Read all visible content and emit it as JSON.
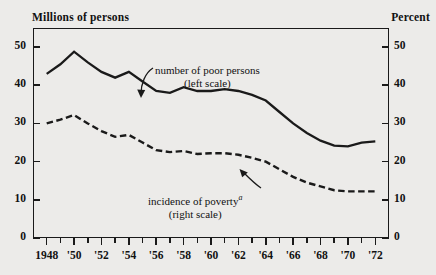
{
  "axis_titles": {
    "left": "Millions of persons",
    "right": "Percent"
  },
  "annotations": {
    "series_a_line1": "number of poor persons",
    "series_a_line2": "(left scale)",
    "series_b_line1": "incidence of poverty",
    "series_b_footnote_marker": "a",
    "series_b_line2": "(right scale)"
  },
  "colors": {
    "ink": "#1a1a1a",
    "paper": "#ecebe9"
  },
  "chart_data": {
    "type": "line",
    "title": "",
    "subtitle": "",
    "xlabel": "",
    "ylabel": "Millions of persons",
    "y2label": "Percent",
    "grid": false,
    "legend": "annotations-inline",
    "xlim": [
      1947,
      1973
    ],
    "ylim": [
      0,
      55
    ],
    "y2lim": [
      0,
      55
    ],
    "y_ticks": [
      0,
      10,
      20,
      30,
      40,
      50
    ],
    "y2_ticks": [
      0,
      10,
      20,
      30,
      40,
      50
    ],
    "x_ticks_major": [
      1948,
      1950,
      1952,
      1954,
      1956,
      1958,
      1960,
      1962,
      1964,
      1966,
      1968,
      1970,
      1972
    ],
    "x_tick_labels": [
      "1948",
      "'50",
      "'52",
      "'54",
      "'56",
      "'58",
      "'60",
      "'62",
      "'64",
      "'66",
      "'68",
      "'70",
      "'72"
    ],
    "x_ticks_minor": [
      1949,
      1951,
      1953,
      1955,
      1957,
      1959,
      1961,
      1963,
      1965,
      1967,
      1969,
      1971
    ],
    "x": [
      1948,
      1949,
      1950,
      1951,
      1952,
      1953,
      1954,
      1955,
      1956,
      1957,
      1958,
      1959,
      1960,
      1961,
      1962,
      1963,
      1964,
      1965,
      1966,
      1967,
      1968,
      1969,
      1970,
      1971,
      1972
    ],
    "series": [
      {
        "name": "number of poor persons",
        "axis": "left",
        "units": "millions of persons",
        "style": "solid",
        "values": [
          43.0,
          45.5,
          48.8,
          46.0,
          43.5,
          42.0,
          43.5,
          41.0,
          38.5,
          38.0,
          39.5,
          38.5,
          38.5,
          39.0,
          38.5,
          37.5,
          36.0,
          33.0,
          30.0,
          27.5,
          25.5,
          24.2,
          24.0,
          25.0,
          25.3
        ]
      },
      {
        "name": "incidence of poverty",
        "axis": "right",
        "units": "percent",
        "style": "dashed",
        "values": [
          30.0,
          31.0,
          32.2,
          30.0,
          28.0,
          26.5,
          27.0,
          25.0,
          23.0,
          22.5,
          22.8,
          22.0,
          22.2,
          22.2,
          21.8,
          21.0,
          20.0,
          18.0,
          16.0,
          14.5,
          13.5,
          12.5,
          12.2,
          12.2,
          12.2
        ]
      }
    ]
  }
}
